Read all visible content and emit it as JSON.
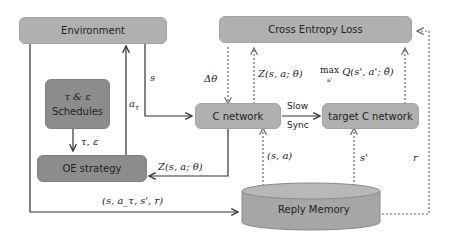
{
  "nodes": {
    "environment": "Environment",
    "schedules_line1": "τ & ε",
    "schedules_line2": "Schedules",
    "oe_strategy": "OE strategy",
    "cross_entropy_loss": "Cross Entropy Loss",
    "c_network": "C network",
    "target_c_network": "target C network",
    "reply_memory": "Reply Memory"
  },
  "edge_labels": {
    "state": "s",
    "action": "a_τ",
    "schedule_params": "τ, ε",
    "z_to_oe": "Z(s, a; θ)",
    "transition": "(s, a_τ, s', r)",
    "delta_theta": "Δθ",
    "z_to_loss": "Z(s, a; θ)",
    "max_q": "max Q(s', a'; θ̃)",
    "max_sub": "a'",
    "slow": "Slow",
    "sync": "Sync",
    "sa_sample": "(s, a)",
    "s_prime": "s'",
    "reward": "r"
  },
  "colors": {
    "light_box": "#b0b0b0",
    "dark_box": "#8c8c8c",
    "line": "#333333",
    "dashed_line": "#666666"
  }
}
